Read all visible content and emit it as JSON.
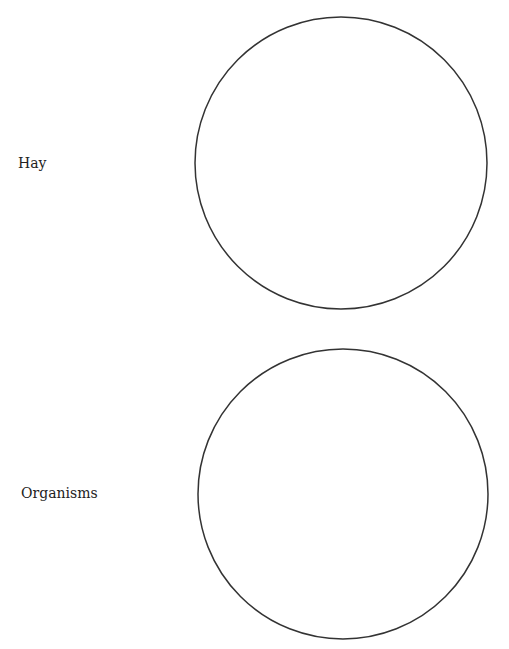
{
  "diagram": {
    "items": [
      {
        "label": "Hay"
      },
      {
        "label": "Organisms"
      }
    ],
    "stroke_color": "#333333"
  }
}
